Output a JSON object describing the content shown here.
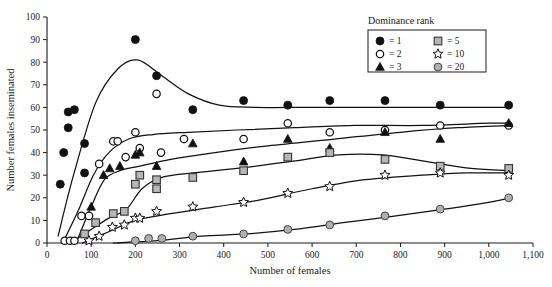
{
  "chart_data": {
    "type": "scatter",
    "title": "",
    "xlabel": "Number of females",
    "ylabel": "Number females inseminated",
    "xlim": [
      0,
      1100
    ],
    "ylim": [
      0,
      100
    ],
    "xticks": [
      0,
      100,
      200,
      300,
      400,
      500,
      600,
      700,
      800,
      900,
      1000,
      1100
    ],
    "xticklabels": [
      "0",
      "100",
      "200",
      "300",
      "400",
      "500",
      "600",
      "700",
      "800",
      "900",
      "1,000",
      "1,100"
    ],
    "yticks": [
      0,
      10,
      20,
      30,
      40,
      50,
      60,
      70,
      80,
      90,
      100
    ],
    "yticklabels": [
      "0",
      "10",
      "20",
      "30",
      "40",
      "50",
      "60",
      "70",
      "80",
      "90",
      "100"
    ],
    "grid": false,
    "legend_position": "top-right",
    "legend_title": "Dominance rank",
    "legend": [
      {
        "label": "= 1",
        "marker": "filled-circle",
        "rank": 1
      },
      {
        "label": "= 2",
        "marker": "open-circle",
        "rank": 2
      },
      {
        "label": "= 3",
        "marker": "filled-triangle",
        "rank": 3
      },
      {
        "label": "= 5",
        "marker": "gray-square",
        "rank": 5
      },
      {
        "label": "= 10",
        "marker": "open-star",
        "rank": 10
      },
      {
        "label": "= 20",
        "marker": "gray-circle",
        "rank": 20
      }
    ],
    "series": [
      {
        "name": "1",
        "marker": "filled-circle",
        "points": [
          [
            30,
            26
          ],
          [
            38,
            40
          ],
          [
            48,
            58
          ],
          [
            48,
            51
          ],
          [
            62,
            59
          ],
          [
            85,
            44
          ],
          [
            85,
            31
          ],
          [
            200,
            90
          ],
          [
            248,
            74
          ],
          [
            330,
            59
          ],
          [
            445,
            63
          ],
          [
            545,
            61
          ],
          [
            640,
            63
          ],
          [
            765,
            63
          ],
          [
            890,
            61
          ],
          [
            1045,
            61
          ]
        ],
        "fit_curve": [
          [
            25,
            3
          ],
          [
            60,
            30
          ],
          [
            110,
            62
          ],
          [
            160,
            77
          ],
          [
            205,
            81
          ],
          [
            260,
            74
          ],
          [
            320,
            66
          ],
          [
            390,
            61
          ],
          [
            470,
            60
          ],
          [
            600,
            60
          ],
          [
            760,
            60
          ],
          [
            900,
            60
          ],
          [
            1050,
            60
          ]
        ]
      },
      {
        "name": "2",
        "marker": "open-circle",
        "points": [
          [
            40,
            1
          ],
          [
            52,
            1
          ],
          [
            62,
            1
          ],
          [
            78,
            12
          ],
          [
            95,
            12
          ],
          [
            118,
            35
          ],
          [
            150,
            45
          ],
          [
            160,
            45
          ],
          [
            178,
            38
          ],
          [
            200,
            49
          ],
          [
            210,
            42
          ],
          [
            248,
            66
          ],
          [
            258,
            40
          ],
          [
            310,
            46
          ],
          [
            445,
            46
          ],
          [
            545,
            53
          ],
          [
            640,
            49
          ],
          [
            765,
            50
          ],
          [
            890,
            52
          ],
          [
            1045,
            52
          ]
        ],
        "fit_curve": [
          [
            38,
            1
          ],
          [
            70,
            14
          ],
          [
            105,
            30
          ],
          [
            140,
            40
          ],
          [
            185,
            46
          ],
          [
            240,
            48
          ],
          [
            320,
            49
          ],
          [
            430,
            50
          ],
          [
            560,
            51
          ],
          [
            700,
            52
          ],
          [
            850,
            52
          ],
          [
            1000,
            53
          ],
          [
            1050,
            53
          ]
        ]
      },
      {
        "name": "3",
        "marker": "filled-triangle",
        "points": [
          [
            100,
            16
          ],
          [
            128,
            30
          ],
          [
            142,
            33
          ],
          [
            165,
            34
          ],
          [
            200,
            39
          ],
          [
            210,
            40
          ],
          [
            248,
            34
          ],
          [
            330,
            44
          ],
          [
            445,
            36
          ],
          [
            545,
            46
          ],
          [
            640,
            42
          ],
          [
            765,
            49
          ],
          [
            890,
            46
          ],
          [
            1045,
            53
          ]
        ],
        "fit_curve": [
          [
            70,
            2
          ],
          [
            100,
            16
          ],
          [
            130,
            28
          ],
          [
            165,
            32
          ],
          [
            210,
            34
          ],
          [
            280,
            37
          ],
          [
            380,
            40
          ],
          [
            500,
            43
          ],
          [
            650,
            46
          ],
          [
            800,
            49
          ],
          [
            930,
            51
          ],
          [
            1050,
            52
          ]
        ]
      },
      {
        "name": "5",
        "marker": "gray-square",
        "points": [
          [
            85,
            4
          ],
          [
            110,
            9
          ],
          [
            150,
            13
          ],
          [
            175,
            14
          ],
          [
            200,
            26
          ],
          [
            210,
            30
          ],
          [
            248,
            28
          ],
          [
            248,
            24
          ],
          [
            330,
            29
          ],
          [
            445,
            32
          ],
          [
            545,
            38
          ],
          [
            640,
            40
          ],
          [
            765,
            37
          ],
          [
            890,
            34
          ],
          [
            1045,
            33
          ]
        ],
        "fit_curve": [
          [
            60,
            1
          ],
          [
            100,
            6
          ],
          [
            140,
            11
          ],
          [
            180,
            15
          ],
          [
            215,
            24
          ],
          [
            260,
            29
          ],
          [
            330,
            31
          ],
          [
            430,
            33
          ],
          [
            550,
            36
          ],
          [
            660,
            39
          ],
          [
            760,
            39
          ],
          [
            860,
            36
          ],
          [
            960,
            33
          ],
          [
            1050,
            32
          ]
        ]
      },
      {
        "name": "10",
        "marker": "open-star",
        "points": [
          [
            95,
            1
          ],
          [
            118,
            3
          ],
          [
            148,
            7
          ],
          [
            175,
            8
          ],
          [
            200,
            11
          ],
          [
            210,
            11
          ],
          [
            248,
            14
          ],
          [
            330,
            16
          ],
          [
            445,
            18
          ],
          [
            545,
            22
          ],
          [
            640,
            25
          ],
          [
            765,
            30
          ],
          [
            890,
            31
          ],
          [
            1045,
            30
          ]
        ],
        "fit_curve": [
          [
            80,
            0
          ],
          [
            140,
            5
          ],
          [
            200,
            10
          ],
          [
            280,
            13
          ],
          [
            380,
            16
          ],
          [
            480,
            19
          ],
          [
            600,
            24
          ],
          [
            720,
            28
          ],
          [
            850,
            30
          ],
          [
            950,
            31
          ],
          [
            1050,
            31
          ]
        ]
      },
      {
        "name": "20",
        "marker": "gray-circle",
        "points": [
          [
            200,
            1
          ],
          [
            230,
            2
          ],
          [
            260,
            2
          ],
          [
            330,
            3
          ],
          [
            445,
            4
          ],
          [
            545,
            6
          ],
          [
            640,
            8
          ],
          [
            765,
            12
          ],
          [
            890,
            15
          ],
          [
            1045,
            20
          ]
        ],
        "fit_curve": [
          [
            150,
            0
          ],
          [
            250,
            1
          ],
          [
            350,
            3
          ],
          [
            450,
            4
          ],
          [
            560,
            6
          ],
          [
            670,
            9
          ],
          [
            790,
            12
          ],
          [
            900,
            15
          ],
          [
            1000,
            18
          ],
          [
            1050,
            20
          ]
        ]
      }
    ]
  }
}
